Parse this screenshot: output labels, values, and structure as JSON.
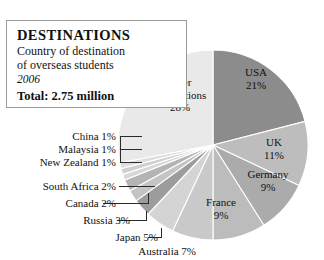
{
  "card": {
    "title": "DESTINATIONS",
    "subtitle_line1": "Country of destination",
    "subtitle_line2": "of overseas students",
    "year": "2006",
    "total": "Total: 2.75 million"
  },
  "chart_data": {
    "type": "pie",
    "title": "DESTINATIONS",
    "subtitle": "Country of destination of overseas students",
    "year": "2006",
    "total": "2.75 million",
    "unit": "percent",
    "start_angle_deg": 0,
    "direction": "clockwise",
    "legend": "none",
    "grid": false,
    "categories": [
      "USA",
      "UK",
      "Germany",
      "France",
      "Australia",
      "Japan",
      "Russia",
      "Canada",
      "South Africa",
      "New Zealand",
      "Malaysia",
      "China",
      "other destinations"
    ],
    "values": [
      21,
      11,
      9,
      9,
      7,
      5,
      3,
      2,
      2,
      1,
      1,
      1,
      28
    ],
    "slices": [
      {
        "name": "USA",
        "value": 21,
        "label": "USA",
        "pct_label": "21%",
        "color": "#8c8c8c",
        "label_placement": "inside"
      },
      {
        "name": "UK",
        "value": 11,
        "label": "UK",
        "pct_label": "11%",
        "color": "#bdbdbd",
        "label_placement": "inside"
      },
      {
        "name": "Germany",
        "value": 9,
        "label": "Germany",
        "pct_label": "9%",
        "color": "#ababab",
        "label_placement": "inside"
      },
      {
        "name": "France",
        "value": 9,
        "label": "France",
        "pct_label": "9%",
        "color": "#bcbcbc",
        "label_placement": "inside"
      },
      {
        "name": "Australia",
        "value": 7,
        "label": "Australia 7%",
        "pct_label": "7%",
        "color": "#c9c9c9",
        "label_placement": "outside"
      },
      {
        "name": "Japan",
        "value": 5,
        "label": "Japan 5%",
        "pct_label": "5%",
        "color": "#d4d4d4",
        "label_placement": "outside"
      },
      {
        "name": "Russia",
        "value": 3,
        "label": "Russia 3%",
        "pct_label": "3%",
        "color": "#9c9c9c",
        "label_placement": "outside"
      },
      {
        "name": "Canada",
        "value": 2,
        "label": "Canada 2%",
        "pct_label": "2%",
        "color": "#c4c4c4",
        "label_placement": "outside"
      },
      {
        "name": "South Africa",
        "value": 2,
        "label": "South Africa 2%",
        "pct_label": "2%",
        "color": "#b4b4b4",
        "label_placement": "outside"
      },
      {
        "name": "New Zealand",
        "value": 1,
        "label": "New Zealand 1%",
        "pct_label": "1%",
        "color": "#d8d8d8",
        "label_placement": "outside"
      },
      {
        "name": "Malaysia",
        "value": 1,
        "label": "Malaysia 1%",
        "pct_label": "1%",
        "color": "#cfcfcf",
        "label_placement": "outside"
      },
      {
        "name": "China",
        "value": 1,
        "label": "China 1%",
        "pct_label": "1%",
        "color": "#dedede",
        "label_placement": "outside"
      },
      {
        "name": "other destinations",
        "value": 28,
        "label": "other destinations",
        "pct_label": "28%",
        "color": "#e9e9e9",
        "label_placement": "inside"
      }
    ],
    "colors": {
      "background": "#ffffff",
      "slice_divider": "#ffffff",
      "text": "#111111",
      "card_border": "#9a9a9a",
      "leader_line": "#2b2b2b"
    }
  },
  "labels": {
    "usa_name": "USA",
    "usa_pct": "21%",
    "uk_name": "UK",
    "uk_pct": "11%",
    "germany_name": "Germany",
    "germany_pct": "9%",
    "france_name": "France",
    "france_pct": "9%",
    "other_l1": "other",
    "other_l2": "destinations",
    "other_pct": "28%",
    "china": "China 1%",
    "malaysia": "Malaysia 1%",
    "new_zealand": "New Zealand 1%",
    "south_africa": "South Africa 2%",
    "canada": "Canada 2%",
    "russia": "Russia 3%",
    "japan": "Japan 5%",
    "australia": "Australia 7%"
  }
}
